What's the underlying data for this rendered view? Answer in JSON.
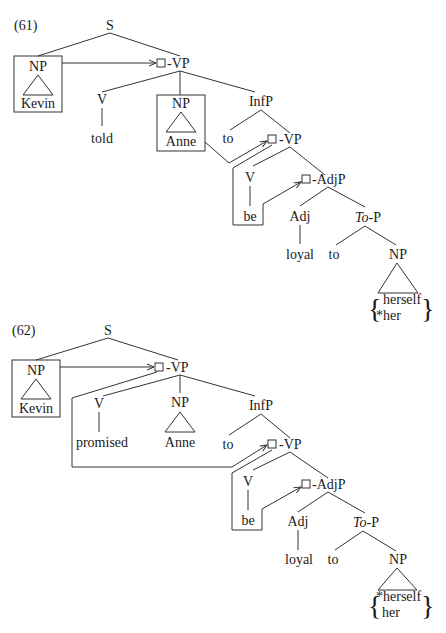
{
  "examples": [
    {
      "number": "(61)",
      "nodes": {
        "S": "S",
        "subject_np": "NP",
        "subject": "Kevin",
        "vp": "-VP",
        "v": "V",
        "verb": "told",
        "object_np": "NP",
        "object": "Anne",
        "infp": "InfP",
        "inf_to": "to",
        "inner_vp": "-VP",
        "inner_v": "V",
        "be": "be",
        "adjp": "-AdjP",
        "adj": "Adj",
        "adj_word": "loyal",
        "top_italic": "To",
        "top_rest": "-P",
        "p_to": "to",
        "np": "NP",
        "option1": "herself",
        "option2": "*her"
      }
    },
    {
      "number": "(62)",
      "nodes": {
        "S": "S",
        "subject_np": "NP",
        "subject": "Kevin",
        "vp": "-VP",
        "v": "V",
        "verb": "promised",
        "object_np": "NP",
        "object": "Anne",
        "infp": "InfP",
        "inf_to": "to",
        "inner_vp": "-VP",
        "inner_v": "V",
        "be": "be",
        "adjp": "-AdjP",
        "adj": "Adj",
        "adj_word": "loyal",
        "top_italic": "To",
        "top_rest": "-P",
        "p_to": "to",
        "np": "NP",
        "option1": "*herself",
        "option2": "her"
      }
    }
  ]
}
